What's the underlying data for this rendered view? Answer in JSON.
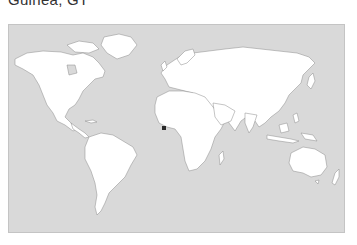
{
  "header": {
    "title": "Guinea, GT"
  },
  "map": {
    "projection": "world-miller",
    "background_color": "#d9d9d9",
    "land_color": "#ffffff",
    "border_color": "#c4c4c4",
    "marker": {
      "label": "location-marker",
      "color": "#2a2a2a",
      "region": "West Africa, Gulf of Guinea coast"
    }
  }
}
